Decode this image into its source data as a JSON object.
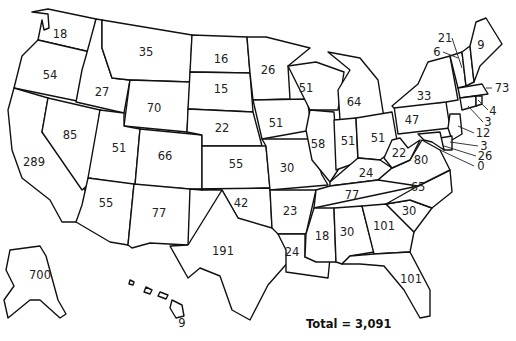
{
  "title": "",
  "total_label": "Total = 3,091",
  "states": [
    {
      "id": "WA",
      "value": "18",
      "x": 60,
      "y": 34
    },
    {
      "id": "OR",
      "value": "54",
      "x": 50,
      "y": 75
    },
    {
      "id": "CA",
      "value": "289",
      "x": 34,
      "y": 162
    },
    {
      "id": "ID",
      "value": "27",
      "x": 102,
      "y": 92
    },
    {
      "id": "NV",
      "value": "85",
      "x": 70,
      "y": 135
    },
    {
      "id": "MT",
      "value": "35",
      "x": 146,
      "y": 52
    },
    {
      "id": "WY",
      "value": "70",
      "x": 154,
      "y": 108
    },
    {
      "id": "UT",
      "value": "51",
      "x": 119,
      "y": 148
    },
    {
      "id": "CO",
      "value": "66",
      "x": 165,
      "y": 156
    },
    {
      "id": "AZ",
      "value": "55",
      "x": 106,
      "y": 203
    },
    {
      "id": "NM",
      "value": "77",
      "x": 159,
      "y": 213
    },
    {
      "id": "ND",
      "value": "16",
      "x": 221,
      "y": 59
    },
    {
      "id": "SD",
      "value": "15",
      "x": 221,
      "y": 89
    },
    {
      "id": "NE",
      "value": "22",
      "x": 222,
      "y": 128
    },
    {
      "id": "KS",
      "value": "55",
      "x": 236,
      "y": 164
    },
    {
      "id": "OK",
      "value": "42",
      "x": 241,
      "y": 203
    },
    {
      "id": "TX",
      "value": "191",
      "x": 223,
      "y": 251
    },
    {
      "id": "MN",
      "value": "26",
      "x": 268,
      "y": 70
    },
    {
      "id": "IA",
      "value": "51",
      "x": 276,
      "y": 123
    },
    {
      "id": "MO",
      "value": "30",
      "x": 287,
      "y": 168
    },
    {
      "id": "AR",
      "value": "23",
      "x": 290,
      "y": 211
    },
    {
      "id": "LA",
      "value": "24",
      "x": 292,
      "y": 252
    },
    {
      "id": "WI",
      "value": "51",
      "x": 306,
      "y": 88
    },
    {
      "id": "IL",
      "value": "58",
      "x": 318,
      "y": 144
    },
    {
      "id": "MI",
      "value": "64",
      "x": 354,
      "y": 102
    },
    {
      "id": "IN",
      "value": "51",
      "x": 348,
      "y": 141
    },
    {
      "id": "OH",
      "value": "51",
      "x": 378,
      "y": 138
    },
    {
      "id": "KY",
      "value": "24",
      "x": 366,
      "y": 173
    },
    {
      "id": "TN",
      "value": "77",
      "x": 352,
      "y": 195
    },
    {
      "id": "MS",
      "value": "18",
      "x": 322,
      "y": 236
    },
    {
      "id": "AL",
      "value": "30",
      "x": 347,
      "y": 232
    },
    {
      "id": "GA",
      "value": "101",
      "x": 384,
      "y": 226
    },
    {
      "id": "FL",
      "value": "101",
      "x": 411,
      "y": 279
    },
    {
      "id": "SC",
      "value": "30",
      "x": 409,
      "y": 211
    },
    {
      "id": "NC",
      "value": "65",
      "x": 418,
      "y": 187
    },
    {
      "id": "VA",
      "value": "80",
      "x": 421,
      "y": 160
    },
    {
      "id": "WV",
      "value": "22",
      "x": 399,
      "y": 153
    },
    {
      "id": "PA",
      "value": "47",
      "x": 412,
      "y": 120
    },
    {
      "id": "NY",
      "value": "33",
      "x": 424,
      "y": 96
    },
    {
      "id": "ME",
      "value": "9",
      "x": 481,
      "y": 45
    },
    {
      "id": "AK",
      "value": "700",
      "x": 40,
      "y": 275
    },
    {
      "id": "HI",
      "value": "9",
      "x": 182,
      "y": 323
    }
  ],
  "callouts": [
    {
      "id": "VT",
      "value": "21",
      "lx": 445,
      "ly": 38
    },
    {
      "id": "NH",
      "value": "6",
      "lx": 437,
      "ly": 52
    },
    {
      "id": "MA",
      "value": "73",
      "lx": 500,
      "ly": 88
    },
    {
      "id": "RI",
      "value": "4",
      "lx": 492,
      "ly": 111
    },
    {
      "id": "CT",
      "value": "3",
      "lx": 487,
      "ly": 122
    },
    {
      "id": "NJ",
      "value": "12",
      "lx": 482,
      "ly": 133
    },
    {
      "id": "DE",
      "value": "3",
      "lx": 484,
      "ly": 146
    },
    {
      "id": "MD",
      "value": "26",
      "lx": 484,
      "ly": 156
    },
    {
      "id": "DC",
      "value": "0",
      "lx": 481,
      "ly": 166
    }
  ]
}
